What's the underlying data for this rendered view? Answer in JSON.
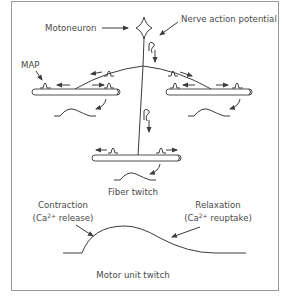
{
  "diagram": {
    "labels": {
      "motoneuron": "Motoneuron",
      "nerve_action_potential": "Nerve action potential",
      "map": "MAP",
      "fiber_twitch": "Fiber twitch",
      "contraction": "Contraction",
      "contraction_detail_prefix": "(Ca",
      "contraction_detail_sup": "2+",
      "contraction_detail_suffix": " release)",
      "relaxation": "Relaxation",
      "relaxation_detail_prefix": "(Ca",
      "relaxation_detail_sup": "2+",
      "relaxation_detail_suffix": " reuptake)",
      "motor_unit_twitch": "Motor unit twitch"
    },
    "colors": {
      "line": "#3c3c3c",
      "text": "#4a4a4a",
      "frame": "#9a9a9a",
      "background": "#ffffff"
    },
    "components": [
      "motoneuron",
      "axon",
      "left-muscle-fiber",
      "right-muscle-fiber",
      "bottom-muscle-fiber",
      "motor-unit-twitch-curve"
    ]
  }
}
